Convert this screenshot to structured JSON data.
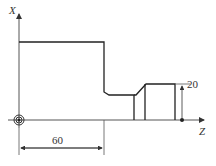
{
  "diagram": {
    "axes": {
      "x_label": "X",
      "z_label": "Z"
    },
    "dimensions": {
      "horizontal": "60",
      "vertical": "20"
    },
    "colors": {
      "line": "#222222",
      "axis": "#555555",
      "background": "#ffffff"
    }
  }
}
